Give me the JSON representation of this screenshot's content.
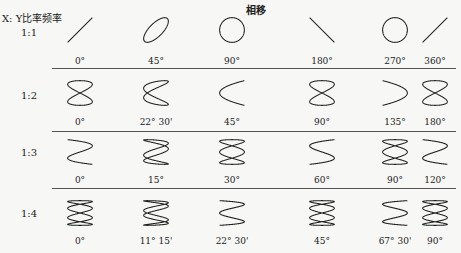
{
  "header": {
    "phase_title": "相移",
    "ratio_title": "X: Y比率频率"
  },
  "rows": [
    {
      "ratio": "1:1",
      "a": 1,
      "b": 1,
      "cells": [
        {
          "label": "0°",
          "shape": "line-up",
          "phase": 0
        },
        {
          "label": "45°",
          "shape": "ellipse-tilt",
          "phase": 45
        },
        {
          "label": "90°",
          "shape": "circle",
          "phase": 90
        },
        {
          "label": "180°",
          "shape": "line-down",
          "phase": 180
        },
        {
          "label": "270°",
          "shape": "circle",
          "phase": 270
        },
        {
          "label": "360°",
          "shape": "line-up",
          "phase": 360
        }
      ]
    },
    {
      "ratio": "1:2",
      "a": 1,
      "b": 2,
      "cells": [
        {
          "label": "0°",
          "shape": "figure-eight",
          "phase": 0
        },
        {
          "label": "22° 30'",
          "shape": "twisted-eight",
          "phase": 22.5
        },
        {
          "label": "45°",
          "shape": "arch-up",
          "phase": 45
        },
        {
          "label": "90°",
          "shape": "figure-eight",
          "phase": 90
        },
        {
          "label": "135°",
          "shape": "arch-down",
          "phase": 135
        },
        {
          "label": "180°",
          "shape": "figure-eight",
          "phase": 180
        }
      ]
    },
    {
      "ratio": "1:3",
      "a": 1,
      "b": 3,
      "cells": [
        {
          "label": "0°",
          "shape": "wave-open",
          "phase": 0
        },
        {
          "label": "15°",
          "shape": "wave-loops",
          "phase": 15
        },
        {
          "label": "30°",
          "shape": "triple-loop",
          "phase": 30
        },
        {
          "label": "60°",
          "shape": "wave-open-inv",
          "phase": 60
        },
        {
          "label": "90°",
          "shape": "triple-loop",
          "phase": 90
        },
        {
          "label": "120°",
          "shape": "wave-open",
          "phase": 120
        }
      ]
    },
    {
      "ratio": "1:4",
      "a": 1,
      "b": 4,
      "cells": [
        {
          "label": "0°",
          "shape": "quad-loop",
          "phase": 0
        },
        {
          "label": "11° 15'",
          "shape": "wave-double",
          "phase": 11.25
        },
        {
          "label": "22° 30'",
          "shape": "wave-w",
          "phase": 22.5
        },
        {
          "label": "45°",
          "shape": "quad-loop",
          "phase": 45
        },
        {
          "label": "67° 30'",
          "shape": "wave-w-inv",
          "phase": 67.5
        },
        {
          "label": "90°",
          "shape": "quad-loop",
          "phase": 90
        }
      ]
    }
  ]
}
